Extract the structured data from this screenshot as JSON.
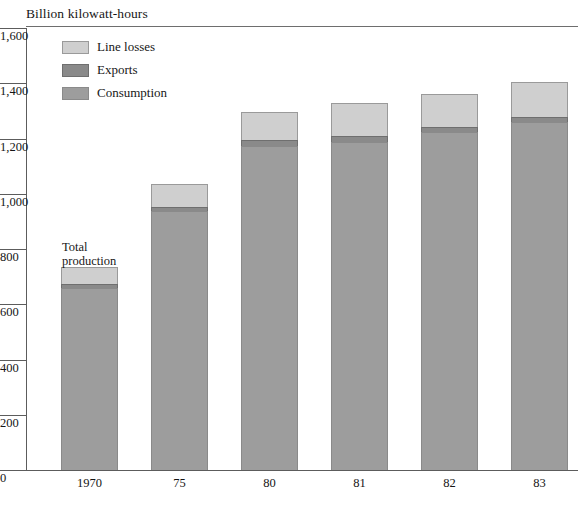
{
  "chart_data": {
    "type": "bar",
    "subtype": "stacked-vertical",
    "title": "Billion kilowatt-hours",
    "xlabel": "",
    "ylabel": "Billion kilowatt-hours",
    "ylim": [
      0,
      1600
    ],
    "yticks": [
      0,
      200,
      400,
      600,
      800,
      1000,
      1200,
      1400,
      1600
    ],
    "ytick_labels": [
      "0",
      "200",
      "400",
      "600",
      "800",
      "1,000",
      "1,200",
      "1,400",
      "1,600"
    ],
    "grid": false,
    "legend_position": "upper-left-inside",
    "categories": [
      "1970",
      "75",
      "80",
      "81",
      "82",
      "83"
    ],
    "series": [
      {
        "name": "Consumption",
        "color": "#9d9d9d",
        "values": [
          659,
          938,
          1173,
          1187,
          1224,
          1260
        ]
      },
      {
        "name": "Exports",
        "color": "#8a8a8a",
        "values": [
          14,
          14,
          22,
          22,
          17,
          18
        ]
      },
      {
        "name": "Line losses",
        "color": "#cfcfcf",
        "values": [
          62,
          83,
          101,
          120,
          120,
          127
        ]
      }
    ],
    "totals": [
      735,
      1035,
      1296,
      1329,
      1361,
      1405
    ],
    "annotations": [
      {
        "text": "Total\nproduction",
        "target": "1970"
      }
    ]
  },
  "legend": {
    "items": [
      {
        "label": "Line losses",
        "swatch": "losses"
      },
      {
        "label": "Exports",
        "swatch": "exports"
      },
      {
        "label": "Consumption",
        "swatch": "consumption"
      }
    ]
  },
  "annotation": {
    "total_production": "Total\nproduction"
  },
  "colors": {
    "line_losses": "#cfcfcf",
    "exports": "#8a8a8a",
    "consumption": "#9d9d9d",
    "axis": "#5c5c5c",
    "text": "#151515"
  }
}
